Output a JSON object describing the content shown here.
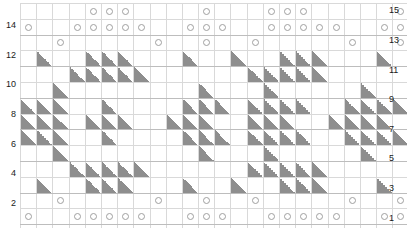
{
  "chart_data": {
    "type": "heatmap",
    "title": "",
    "xlabel": "",
    "ylabel": "",
    "columns": 24,
    "rows": 15,
    "legend": {
      "o": "yarn-over",
      "tri": "decrease",
      "blank": "knit"
    },
    "symbol_colors": {
      "circle_stroke": "#a0a0a0",
      "triangle_fill": "#8e8e8e",
      "grid_line": "#d9d9d9",
      "grid_border": "#b9b9b9"
    },
    "row_labels_left": [
      "",
      "14",
      "",
      "12",
      "",
      "10",
      "",
      "8",
      "",
      "6",
      "",
      "4",
      "",
      "2",
      ""
    ],
    "row_labels_right": [
      "15",
      "",
      "13",
      "",
      "11",
      "",
      "9",
      "",
      "7",
      "",
      "5",
      "",
      "3",
      "",
      "1"
    ],
    "row_numbers": [
      15,
      14,
      13,
      12,
      11,
      10,
      9,
      8,
      7,
      6,
      5,
      4,
      3,
      2,
      1
    ],
    "cells": [
      [
        "",
        "",
        "",
        "",
        "o",
        "o",
        "o",
        "",
        "",
        "",
        "",
        "o",
        "",
        "",
        "",
        "o",
        "o",
        "o",
        "",
        "",
        "",
        "",
        "",
        "o"
      ],
      [
        "o",
        "",
        "",
        "o",
        "o",
        "o",
        "o",
        "o",
        "",
        "",
        "o",
        "o",
        "o",
        "",
        "",
        "o",
        "o",
        "o",
        "o",
        "o",
        "",
        "",
        "o",
        "o"
      ],
      [
        "",
        "",
        "o",
        "",
        "",
        "",
        "",
        "",
        "o",
        "",
        "",
        "o",
        "",
        "",
        "o",
        "",
        "",
        "",
        "",
        "",
        "o",
        "",
        "",
        "o"
      ],
      [
        "",
        "tri",
        "",
        "",
        "tri",
        "tri",
        "tri",
        "",
        "",
        "",
        "tri",
        "",
        "",
        "tri",
        "",
        "",
        "tri",
        "tri",
        "tri",
        "",
        "",
        "",
        "tri",
        ""
      ],
      [
        "",
        "",
        "",
        "tri",
        "tri",
        "tri",
        "tri",
        "tri",
        "",
        "",
        "",
        "",
        "",
        "",
        "tri",
        "tri",
        "tri",
        "tri",
        "tri",
        "",
        "",
        "",
        "",
        ""
      ],
      [
        "",
        "",
        "tri",
        "",
        "",
        "",
        "",
        "",
        "",
        "",
        "",
        "tri",
        "",
        "",
        "",
        "tri",
        "",
        "",
        "",
        "",
        "",
        "tri",
        "",
        ""
      ],
      [
        "tri",
        "tri",
        "tri",
        "",
        "",
        "tri",
        "",
        "",
        "",
        "",
        "tri",
        "tri",
        "tri",
        "",
        "tri",
        "tri",
        "tri",
        "tri",
        "",
        "",
        "tri",
        "tri",
        "tri",
        "tri"
      ],
      [
        "tri",
        "tri",
        "tri",
        "",
        "tri",
        "tri",
        "tri",
        "",
        "",
        "tri",
        "tri",
        "tri",
        "",
        "",
        "tri",
        "tri",
        "tri",
        "",
        "",
        "tri",
        "tri",
        "tri",
        "tri",
        ""
      ],
      [
        "tri",
        "tri",
        "tri",
        "",
        "",
        "tri",
        "",
        "",
        "",
        "",
        "tri",
        "tri",
        "tri",
        "",
        "tri",
        "tri",
        "tri",
        "tri",
        "",
        "",
        "tri",
        "tri",
        "tri",
        "tri"
      ],
      [
        "",
        "",
        "tri",
        "",
        "",
        "",
        "",
        "",
        "",
        "",
        "",
        "tri",
        "",
        "",
        "",
        "tri",
        "",
        "",
        "",
        "",
        "",
        "tri",
        "",
        ""
      ],
      [
        "",
        "",
        "",
        "tri",
        "tri",
        "tri",
        "tri",
        "tri",
        "",
        "",
        "",
        "",
        "",
        "",
        "tri",
        "tri",
        "tri",
        "tri",
        "tri",
        "",
        "",
        "",
        "",
        ""
      ],
      [
        "",
        "tri",
        "",
        "",
        "tri",
        "tri",
        "tri",
        "",
        "",
        "",
        "tri",
        "",
        "",
        "tri",
        "",
        "",
        "tri",
        "tri",
        "tri",
        "",
        "",
        "",
        "tri",
        ""
      ],
      [
        "",
        "",
        "o",
        "",
        "",
        "",
        "",
        "",
        "o",
        "",
        "",
        "o",
        "",
        "",
        "o",
        "",
        "",
        "",
        "",
        "",
        "o",
        "",
        "",
        "o"
      ],
      [
        "o",
        "",
        "",
        "o",
        "o",
        "o",
        "o",
        "o",
        "",
        "",
        "o",
        "o",
        "o",
        "",
        "",
        "o",
        "o",
        "o",
        "o",
        "o",
        "",
        "",
        "o",
        "o"
      ],
      [
        "",
        "",
        "",
        "",
        "o",
        "o",
        "o",
        "",
        "",
        "",
        "",
        "o",
        "",
        "",
        "",
        "o",
        "o",
        "o",
        "",
        "",
        "",
        "",
        "",
        "o"
      ]
    ]
  }
}
